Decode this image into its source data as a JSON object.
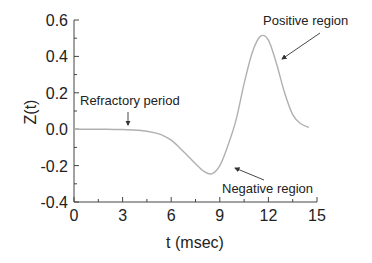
{
  "chart_data": {
    "type": "line",
    "title": "",
    "xlabel": "t (msec)",
    "ylabel": "Z(t)",
    "xlim": [
      0,
      15
    ],
    "ylim": [
      -0.4,
      0.6
    ],
    "xticks": [
      0,
      3,
      6,
      9,
      12,
      15
    ],
    "xtick_labels": [
      "0",
      "3",
      "6",
      "9",
      "12",
      "15"
    ],
    "yticks": [
      -0.4,
      -0.2,
      0.0,
      0.2,
      0.4,
      0.6
    ],
    "ytick_labels": [
      "-0.4",
      "-0.2",
      "0.0",
      "0.2",
      "0.4",
      "0.6"
    ],
    "grid": false,
    "legend": null,
    "series": [
      {
        "name": "Z(t)",
        "color": "#b0b0b0",
        "x": [
          0,
          1,
          2,
          3,
          4,
          5,
          5.5,
          6,
          6.5,
          7,
          7.5,
          8,
          8.5,
          9,
          9.5,
          10,
          10.5,
          11,
          11.5,
          12,
          12.5,
          13,
          13.5,
          14,
          14.5
        ],
        "y": [
          0.0,
          0.0,
          0.0,
          -0.002,
          -0.006,
          -0.02,
          -0.035,
          -0.06,
          -0.1,
          -0.145,
          -0.19,
          -0.23,
          -0.245,
          -0.2,
          -0.09,
          0.05,
          0.25,
          0.42,
          0.51,
          0.49,
          0.36,
          0.2,
          0.08,
          0.03,
          0.01
        ]
      }
    ],
    "annotations": [
      {
        "text": "Refractory period",
        "arrow_to": [
          3.3,
          0.0
        ]
      },
      {
        "text": "Negative region",
        "arrow_to": [
          9.8,
          -0.22
        ]
      },
      {
        "text": "Positive region",
        "arrow_to": [
          12.8,
          0.37
        ]
      }
    ]
  }
}
